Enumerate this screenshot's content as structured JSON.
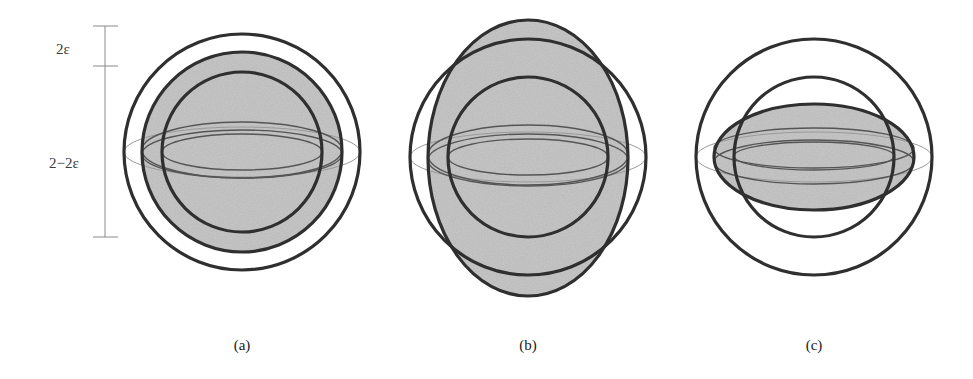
{
  "figure": {
    "scale_bar": {
      "top_label": "2ε",
      "bottom_label": "2−2ε"
    },
    "panels": [
      {
        "id": "a",
        "label": "(a)",
        "description": "Sphere of radius 1 shaded between outer radius 1+ε and inner radius 1−ε shells"
      },
      {
        "id": "b",
        "label": "(b)",
        "description": "Prolate (vertically elongated) shaded ellipsoid crossing outer and inner shells"
      },
      {
        "id": "c",
        "label": "(c)",
        "description": "Oblate (flattened) shaded ellipsoid crossing inner shell, inside outer shell"
      }
    ],
    "colors": {
      "stroke_dark": "#2f2f2f",
      "stroke_light": "#9a9a9a",
      "fill_shade": "#c9c9c9",
      "background": "#ffffff"
    }
  }
}
